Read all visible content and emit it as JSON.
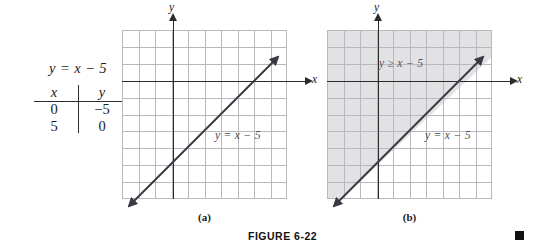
{
  "figure": {
    "caption": "FIGURE 6-22",
    "end_marker": "filled-square"
  },
  "equation_block": {
    "equation": "y = x − 5",
    "table": {
      "headers": [
        "x",
        "y"
      ],
      "rows": [
        [
          "0",
          "−5"
        ],
        [
          "5",
          "0"
        ]
      ]
    }
  },
  "panels": [
    {
      "caption": "(a)",
      "x_axis_label": "x",
      "y_axis_label": "y",
      "line_label": "y = x − 5",
      "shaded": false,
      "region_label": ""
    },
    {
      "caption": "(b)",
      "x_axis_label": "x",
      "y_axis_label": "y",
      "line_label": "y = x − 5",
      "shaded": true,
      "region_label": "y ≥ x − 5"
    }
  ],
  "colors": {
    "grid": "#b9b9bd",
    "axis": "#2b2b2b",
    "line": "#3a3a42",
    "shade": "#e2e2e4",
    "text": "#1a1a1a"
  },
  "chart_data": {
    "type": "line",
    "title": "FIGURE 6-22",
    "xlabel": "x",
    "ylabel": "y",
    "xlim": [
      -3,
      7
    ],
    "ylim": [
      -7,
      3
    ],
    "grid": true,
    "legend": "none",
    "series": [
      {
        "name": "y = x − 5",
        "equation": "y = x - 5",
        "slope": 1,
        "intercept": -5,
        "points": [
          [
            0,
            -5
          ],
          [
            5,
            0
          ]
        ],
        "style": "solid",
        "arrows": "both"
      }
    ],
    "regions": [
      {
        "name": "y ≥ x − 5",
        "panel": "(b)",
        "fill": "#e2e2e4",
        "boundary": "solid",
        "side": "above"
      }
    ]
  }
}
